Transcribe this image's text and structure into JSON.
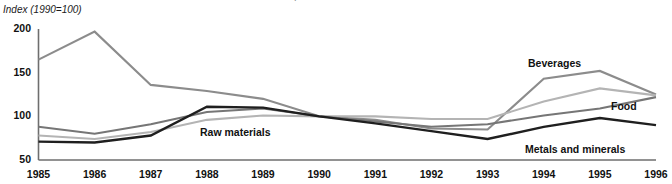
{
  "chart_data": {
    "type": "line",
    "title": "Price indices relative to manufactures unit value index, 1985-96",
    "subtitle": "Index (1990=100)",
    "xlabel": "",
    "ylabel": "Index (1990=100)",
    "x": [
      1985,
      1986,
      1987,
      1988,
      1989,
      1990,
      1991,
      1992,
      1993,
      1994,
      1995,
      1996
    ],
    "categories": [
      "1985",
      "1986",
      "1987",
      "1988",
      "1989",
      "1990",
      "1991",
      "1992",
      "1993",
      "1994",
      "1995",
      "1996"
    ],
    "ylim": [
      50,
      200
    ],
    "yticks": [
      50,
      100,
      150,
      200
    ],
    "ytick_labels": [
      "50",
      "100",
      "150",
      "200"
    ],
    "xlim": [
      1985,
      1996
    ],
    "grid": false,
    "legend_position": "inline-annotations",
    "series": [
      {
        "name": "Beverages",
        "color": "#8c8c8c",
        "width": 2.1,
        "values": [
          165,
          197,
          136,
          129,
          120,
          100,
          96,
          86,
          85,
          143,
          152,
          125
        ],
        "label_x": 528,
        "label_y": 57
      },
      {
        "name": "Food",
        "color": "#b4b4b4",
        "width": 2.1,
        "values": [
          78,
          74,
          82,
          96,
          101,
          100,
          100,
          97,
          97,
          117,
          132,
          124
        ],
        "label_x": 611,
        "label_y": 100
      },
      {
        "name": "Raw materials",
        "color": "#767676",
        "width": 2.1,
        "values": [
          88,
          80,
          91,
          105,
          109,
          100,
          94,
          88,
          91,
          101,
          109,
          122
        ],
        "label_x": 200,
        "label_y": 126
      },
      {
        "name": "Metals and minerals",
        "color": "#1f1f1f",
        "width": 2.4,
        "values": [
          71,
          70,
          78,
          111,
          110,
          100,
          92,
          83,
          74,
          88,
          98,
          90
        ],
        "label_x": 525,
        "label_y": 143
      }
    ],
    "annotations": [
      {
        "text": "Beverages"
      },
      {
        "text": "Food"
      },
      {
        "text": "Raw materials"
      },
      {
        "text": "Metals and minerals"
      }
    ],
    "axis_color": "#6e6e6e"
  }
}
